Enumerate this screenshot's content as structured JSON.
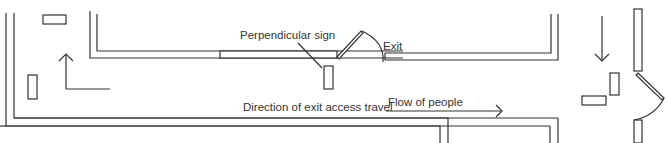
{
  "diagram": {
    "type": "floor-plan-exit-signage",
    "colors": {
      "line": "#333333",
      "background": "#ffffff"
    },
    "labels": {
      "perpendicular_sign": "Perpendicular sign",
      "exit": "Exit",
      "direction": "Direction of exit access travel",
      "flow": "Flow of people"
    },
    "elements": {
      "outer_corridor_walls": "double-line wall along left and bottom",
      "inner_room_walls": "double-line walls forming room with exit door",
      "signs": [
        "wall sign top-left",
        "wall sign left",
        "perpendicular sign near exit",
        "perpendicular sign right",
        "wall sign right"
      ],
      "arrows": [
        "up-turn arrow left",
        "flow arrow right",
        "down arrow right"
      ],
      "doors": [
        "exit door in room wall",
        "exit door in right wall"
      ]
    }
  }
}
